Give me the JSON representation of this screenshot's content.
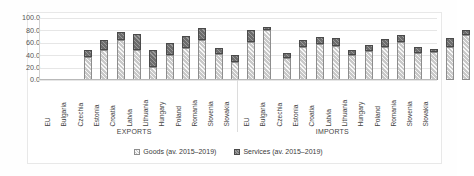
{
  "chart_data": {
    "type": "bar",
    "stacked": true,
    "title": "",
    "xlabel": "",
    "ylabel": "",
    "ylim": [
      0,
      100
    ],
    "yticks": [
      "0.0",
      "20.0",
      "40.0",
      "60.0",
      "80.0",
      "100.0"
    ],
    "grid": true,
    "legend_position": "bottom",
    "groups": [
      {
        "name": "EXPORTS",
        "categories": [
          "EU",
          "Bulgaria",
          "Czechia",
          "Estonia",
          "Croatia",
          "Latvia",
          "Lithuania",
          "Hungary",
          "Poland",
          "Romania",
          "Slovenia",
          "Slovakia"
        ],
        "series": [
          {
            "name": "Goods (av. 2015–2019)",
            "values": [
              37.0,
              49.0,
              64.0,
              49.0,
              21.0,
              41.0,
              51.0,
              65.0,
              42.0,
              29.0,
              62.0,
              80.0
            ]
          },
          {
            "name": "Services (av. 2015–2019)",
            "values": [
              11.0,
              15.0,
              13.0,
              26.0,
              27.0,
              19.0,
              20.0,
              19.0,
              10.0,
              11.0,
              18.0,
              5.0
            ]
          }
        ],
        "totals": [
          48.0,
          64.0,
          77.0,
          75.0,
          48.0,
          60.0,
          71.0,
          84.0,
          52.0,
          40.0,
          80.0,
          85.0
        ]
      },
      {
        "name": "IMPORTS",
        "categories": [
          "EU",
          "Bulgaria",
          "Czechia",
          "Estonia",
          "Croatia",
          "Latvia",
          "Lithuania",
          "Hungary",
          "Poland",
          "Romania",
          "Slovenia",
          "Slovakia"
        ],
        "series": [
          {
            "name": "Goods (av. 2015–2019)",
            "values": [
              35.0,
              53.0,
              58.0,
              55.0,
              41.0,
              46.0,
              53.0,
              62.0,
              44.0,
              45.0,
              54.0,
              72.0
            ]
          },
          {
            "name": "Services (av. 2015–2019)",
            "values": [
              9.0,
              11.0,
              11.0,
              12.0,
              8.0,
              11.0,
              13.0,
              11.0,
              10.0,
              5.0,
              13.0,
              9.0
            ]
          }
        ],
        "totals": [
          44.0,
          64.0,
          69.0,
          67.0,
          49.0,
          57.0,
          66.0,
          73.0,
          54.0,
          50.0,
          67.0,
          81.0
        ]
      }
    ],
    "legend": [
      {
        "label": "Goods (av. 2015–2019)",
        "pattern": "light-hatch",
        "color": "#c9c9c9"
      },
      {
        "label": "Services (av. 2015–2019)",
        "pattern": "dark-hatch",
        "color": "#6d6d6d"
      }
    ]
  }
}
